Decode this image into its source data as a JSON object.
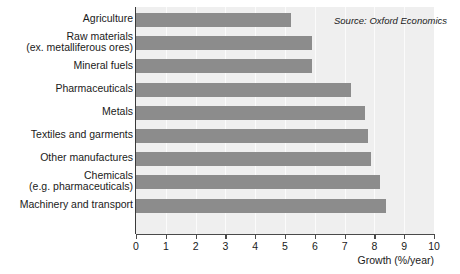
{
  "chart_data": {
    "type": "bar",
    "orientation": "horizontal",
    "title": "",
    "xlabel": "Growth (%/year)",
    "ylabel": "",
    "xlim": [
      0,
      10
    ],
    "xticks": [
      0,
      1,
      2,
      3,
      4,
      5,
      6,
      7,
      8,
      9,
      10
    ],
    "xtick_labels": [
      "0",
      "1",
      "2",
      "3",
      "4",
      "5",
      "6",
      "7",
      "8",
      "9",
      "10"
    ],
    "grid": true,
    "grid_axis": "x",
    "legend": null,
    "categories": [
      "Agriculture",
      "Raw materials\n(ex. metalliferous ores)",
      "Mineral fuels",
      "Pharmaceuticals",
      "Metals",
      "Textiles and garments",
      "Other manufactures",
      "Chemicals\n(e.g. pharmaceuticals)",
      "Machinery and transport"
    ],
    "values": [
      5.2,
      5.9,
      5.9,
      7.2,
      7.7,
      7.8,
      7.9,
      8.2,
      8.4
    ],
    "annotations": [
      {
        "text": "Source: Oxford Economics",
        "style": "italic",
        "position": "top-right-inside"
      }
    ],
    "colors": {
      "bar": "#8c8c8c",
      "plot_background": "#efefef",
      "figure_background": "#ffffff",
      "gridline": "#fbfbfb",
      "axis": "#3a3a3a",
      "text": "#1a1a1a"
    }
  }
}
